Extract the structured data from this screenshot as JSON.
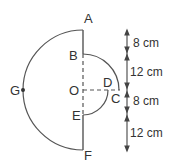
{
  "diagram": {
    "points": {
      "A": "A",
      "B": "B",
      "C": "C",
      "D": "D",
      "E": "E",
      "F": "F",
      "G": "G",
      "O": "O"
    },
    "dimensions": [
      {
        "label": "8 cm"
      },
      {
        "label": "12 cm"
      },
      {
        "label": "8 cm"
      },
      {
        "label": "12 cm"
      }
    ],
    "colors": {
      "stroke": "#555555",
      "text": "#333333"
    }
  }
}
